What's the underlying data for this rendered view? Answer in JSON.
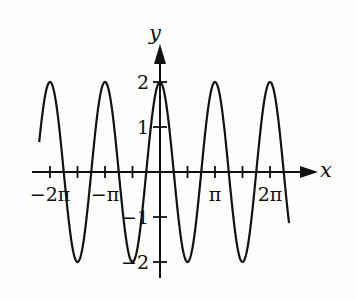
{
  "chart_data": {
    "type": "line",
    "title": "",
    "function": "y = 2cos(2x)",
    "xlabel": "x",
    "ylabel": "y",
    "x_ticks": [
      {
        "value": -6.2832,
        "label": "−2π"
      },
      {
        "value": -4.7124,
        "label": ""
      },
      {
        "value": -3.1416,
        "label": "−π"
      },
      {
        "value": -1.5708,
        "label": ""
      },
      {
        "value": 1.5708,
        "label": ""
      },
      {
        "value": 3.1416,
        "label": "π"
      },
      {
        "value": 4.7124,
        "label": ""
      },
      {
        "value": 6.2832,
        "label": "2π"
      }
    ],
    "y_ticks": [
      {
        "value": 2,
        "label": "2"
      },
      {
        "value": 1,
        "label": "1"
      },
      {
        "value": -1,
        "label": "−1"
      },
      {
        "value": -2,
        "label": "−2"
      }
    ],
    "x_range": [
      -6.9,
      7.4
    ],
    "ylim": [
      -2,
      2
    ],
    "amplitude": 2,
    "period": "π",
    "grid": false,
    "legend": null,
    "series": [
      {
        "name": "2cos(2x)",
        "x_start": -6.9,
        "x_end": 7.37,
        "maxima_at": [
          "−2π",
          "−π",
          "0",
          "π",
          "2π"
        ],
        "minima_at": [
          "−3π/2",
          "−π/2",
          "π/2",
          "3π/2"
        ]
      }
    ],
    "colors": {
      "curve": "#111111",
      "axes": "#111111",
      "background": "#fdfdfb"
    }
  },
  "labels": {
    "x_axis": "x",
    "y_axis": "y"
  }
}
